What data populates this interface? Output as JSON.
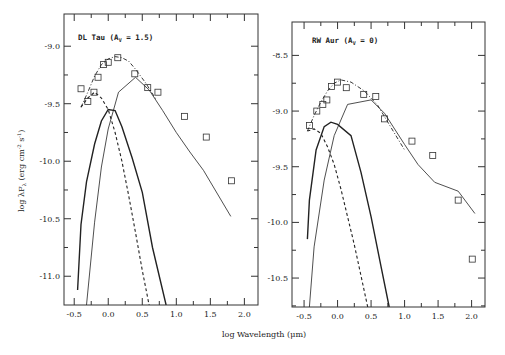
{
  "chart_data": [
    {
      "type": "line",
      "panel": "left",
      "title": "DL Tau (A_V = 1.5)",
      "xlabel": "log Wavelength (μm)",
      "ylabel": "log λF_λ (erg cm^-2 s^-1)",
      "xlim": [
        -0.65,
        2.2
      ],
      "ylim": [
        -11.25,
        -8.72
      ],
      "xticks": [
        -0.5,
        0.0,
        0.5,
        1.0,
        1.5,
        2.0
      ],
      "xtick_labels": [
        "-0.5",
        "0.0",
        "0.5",
        "1.0",
        "1.5",
        "2.0"
      ],
      "yticks": [
        -9.0,
        -9.5,
        -10.0,
        -10.5,
        -11.0
      ],
      "ytick_labels": [
        "-9.0",
        "-9.5",
        "-10.0",
        "-10.5",
        "-11.0"
      ],
      "grid": false,
      "series": [
        {
          "name": "observed",
          "style": "squares",
          "x": [
            -0.4,
            -0.3,
            -0.21,
            -0.15,
            -0.07,
            0.0,
            0.14,
            0.39,
            0.58,
            0.73,
            1.12,
            1.44,
            1.81
          ],
          "y": [
            -9.37,
            -9.48,
            -9.4,
            -9.27,
            -9.16,
            -9.14,
            -9.1,
            -9.24,
            -9.36,
            -9.4,
            -9.61,
            -9.79,
            -10.17
          ]
        },
        {
          "name": "total model",
          "style": "dash-dot",
          "x": [
            -0.4,
            -0.3,
            -0.2,
            -0.1,
            0.0,
            0.1,
            0.2,
            0.3,
            0.4,
            0.55,
            0.7
          ],
          "y": [
            -9.53,
            -9.4,
            -9.26,
            -9.16,
            -9.11,
            -9.09,
            -9.1,
            -9.13,
            -9.2,
            -9.32,
            -9.46
          ]
        },
        {
          "name": "stellar photosphere",
          "style": "dashed",
          "x": [
            -0.4,
            -0.3,
            -0.2,
            -0.1,
            0.0,
            0.1,
            0.2,
            0.3,
            0.4,
            0.5,
            0.6
          ],
          "y": [
            -9.53,
            -9.45,
            -9.4,
            -9.45,
            -9.55,
            -9.75,
            -10.0,
            -10.3,
            -10.62,
            -10.95,
            -11.25
          ]
        },
        {
          "name": "accretion shock",
          "style": "solid-thick",
          "x": [
            -0.45,
            -0.4,
            -0.32,
            -0.2,
            -0.1,
            0.0,
            0.1,
            0.2,
            0.35,
            0.5,
            0.65,
            0.85
          ],
          "y": [
            -11.12,
            -10.55,
            -10.18,
            -9.85,
            -9.65,
            -9.55,
            -9.56,
            -9.7,
            -9.97,
            -10.27,
            -10.75,
            -11.25
          ]
        },
        {
          "name": "disk",
          "style": "solid-thin",
          "x": [
            -0.32,
            -0.2,
            -0.1,
            0.0,
            0.15,
            0.4,
            0.6,
            0.8,
            1.0,
            1.2,
            1.4,
            1.8
          ],
          "y": [
            -11.25,
            -10.53,
            -10.05,
            -9.72,
            -9.4,
            -9.27,
            -9.38,
            -9.56,
            -9.75,
            -9.92,
            -10.08,
            -10.48
          ]
        }
      ]
    },
    {
      "type": "line",
      "panel": "right",
      "title": "RW Aur (A_V = 0)",
      "xlabel": "log Wavelength (μm)",
      "ylabel": "log λF_λ (erg cm^-2 s^-1)",
      "xlim": [
        -0.68,
        2.2
      ],
      "ylim": [
        -10.76,
        -8.2
      ],
      "xticks": [
        -0.5,
        0.0,
        0.5,
        1.0,
        1.5,
        2.0
      ],
      "xtick_labels": [
        "-0.5",
        "0.0",
        "0.5",
        "1.0",
        "1.5",
        "2.0"
      ],
      "yticks": [
        -8.5,
        -9.0,
        -9.5,
        -10.0,
        -10.5
      ],
      "ytick_labels": [
        "-8.5",
        "-9.0",
        "-9.5",
        "-10.0",
        "-10.5"
      ],
      "grid": false,
      "series": [
        {
          "name": "observed",
          "style": "squares",
          "x": [
            -0.42,
            -0.31,
            -0.22,
            -0.16,
            -0.09,
            0.0,
            0.13,
            0.39,
            0.57,
            0.7,
            1.11,
            1.42,
            1.8,
            2.01
          ],
          "y": [
            -9.13,
            -9.0,
            -8.94,
            -8.9,
            -8.78,
            -8.74,
            -8.79,
            -8.85,
            -8.87,
            -9.07,
            -9.27,
            -9.4,
            -9.8,
            -10.33
          ]
        },
        {
          "name": "total model",
          "style": "dash-dot",
          "x": [
            -0.45,
            -0.35,
            -0.25,
            -0.15,
            -0.05,
            0.05,
            0.2,
            0.4,
            0.6,
            0.8,
            1.0
          ],
          "y": [
            -9.18,
            -9.04,
            -8.92,
            -8.82,
            -8.75,
            -8.72,
            -8.74,
            -8.82,
            -8.95,
            -9.15,
            -9.35
          ]
        },
        {
          "name": "stellar photosphere",
          "style": "dashed",
          "x": [
            -0.45,
            -0.35,
            -0.25,
            -0.15,
            -0.05,
            0.05,
            0.15,
            0.25,
            0.35,
            0.45
          ],
          "y": [
            -9.18,
            -9.16,
            -9.2,
            -9.32,
            -9.48,
            -9.7,
            -9.95,
            -10.2,
            -10.48,
            -10.76
          ]
        },
        {
          "name": "accretion shock",
          "style": "solid-thick",
          "x": [
            -0.45,
            -0.42,
            -0.32,
            -0.2,
            -0.1,
            0.0,
            0.2,
            0.35,
            0.5,
            0.65,
            0.77
          ],
          "y": [
            -10.15,
            -9.8,
            -9.35,
            -9.14,
            -9.1,
            -9.12,
            -9.22,
            -9.55,
            -9.95,
            -10.4,
            -10.76
          ]
        },
        {
          "name": "disk",
          "style": "solid-thin",
          "x": [
            -0.42,
            -0.35,
            -0.2,
            -0.05,
            0.15,
            0.5,
            0.7,
            1.0,
            1.2,
            1.45,
            1.8,
            2.05
          ],
          "y": [
            -10.76,
            -10.22,
            -9.62,
            -9.22,
            -8.94,
            -8.9,
            -9.02,
            -9.3,
            -9.48,
            -9.64,
            -9.72,
            -9.92
          ]
        }
      ]
    }
  ],
  "labels": {
    "left_panel_title": "DL Tau (A",
    "left_panel_sub": "V",
    "left_panel_rest": " = 1.5)",
    "right_panel_title": "RW Aur (A",
    "right_panel_sub": "V",
    "right_panel_rest": " = 0)",
    "ylabel_main": "log λF",
    "ylabel_sub": "λ",
    "ylabel_units": "(erg cm",
    "ylabel_exp1": "-2",
    "ylabel_s": " s",
    "ylabel_exp2": "-1",
    "ylabel_close": ")",
    "xlabel": "log Wavelength (μm)"
  }
}
